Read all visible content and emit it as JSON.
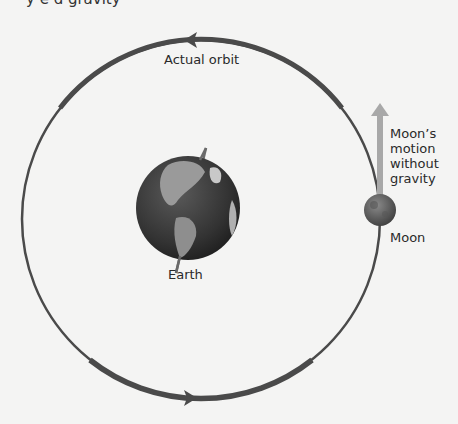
{
  "header": {
    "cut_off_text": "y  e  d        gravity"
  },
  "labels": {
    "orbit": "Actual orbit",
    "earth": "Earth",
    "moon": "Moon",
    "motion": "Moon’s motion without gravity"
  },
  "colors": {
    "background": "#f4f4f3",
    "orbit": "#4a4a4a",
    "motion_arrow": "#a8a8a8",
    "earth_ocean": "#3a3a3a",
    "earth_land": "#9a9a9a",
    "moon": "#6a6a6a"
  },
  "geometry": {
    "orbit_center": [
      201,
      219
    ],
    "orbit_radius": 179,
    "earth_center": [
      188,
      208
    ],
    "earth_radius": 52,
    "moon_center": [
      380,
      210
    ],
    "moon_radius": 16
  }
}
